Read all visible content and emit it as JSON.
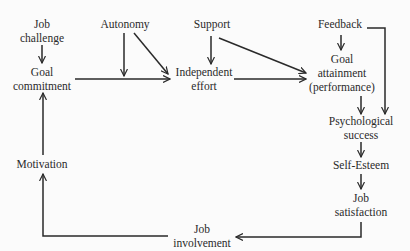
{
  "diagram": {
    "type": "flow-model",
    "nodes": {
      "job_challenge": {
        "line1": "Job",
        "line2": "challenge"
      },
      "goal_commitment": {
        "line1": "Goal",
        "line2": "commitment"
      },
      "autonomy": {
        "line1": "Autonomy"
      },
      "support": {
        "line1": "Support"
      },
      "independent_effort": {
        "line1": "Independent",
        "line2": "effort"
      },
      "feedback": {
        "line1": "Feedback"
      },
      "goal_attainment": {
        "line1": "Goal",
        "line2": "attainment",
        "line3": "(performance)"
      },
      "psychological_success": {
        "line1": "Psychological",
        "line2": "success"
      },
      "self_esteem": {
        "line1": "Self-Esteem"
      },
      "job_satisfaction": {
        "line1": "Job",
        "line2": "satisfaction"
      },
      "job_involvement": {
        "line1": "Job",
        "line2": "involvement"
      },
      "motivation": {
        "line1": "Motivation"
      }
    },
    "edges": [
      {
        "from": "Job challenge",
        "to": "Goal commitment"
      },
      {
        "from": "Goal commitment",
        "to": "Independent effort"
      },
      {
        "from": "Autonomy",
        "to": "Goal commitment → Independent effort link (moderator)"
      },
      {
        "from": "Autonomy",
        "to": "Independent effort"
      },
      {
        "from": "Support",
        "to": "Independent effort"
      },
      {
        "from": "Support",
        "to": "Goal attainment (performance)"
      },
      {
        "from": "Independent effort",
        "to": "Goal attainment (performance)"
      },
      {
        "from": "Feedback",
        "to": "Goal attainment (performance)"
      },
      {
        "from": "Feedback",
        "to": "Psychological success"
      },
      {
        "from": "Goal attainment (performance)",
        "to": "Psychological success"
      },
      {
        "from": "Psychological success",
        "to": "Self-Esteem"
      },
      {
        "from": "Self-Esteem",
        "to": "Job satisfaction"
      },
      {
        "from": "Job satisfaction",
        "to": "Job involvement"
      },
      {
        "from": "Job involvement",
        "to": "Motivation"
      },
      {
        "from": "Motivation",
        "to": "Goal commitment"
      }
    ],
    "colors": {
      "line": "#2a2a2a",
      "background": "#fbfbfb"
    }
  }
}
